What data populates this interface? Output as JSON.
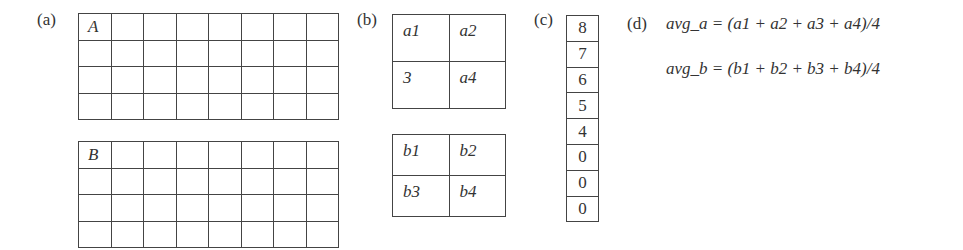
{
  "panels": {
    "a": {
      "label": "(a)",
      "grid_a": {
        "corner_label": "A",
        "rows": 4,
        "cols": 8
      },
      "grid_b": {
        "corner_label": "B",
        "rows": 4,
        "cols": 8
      }
    },
    "b": {
      "label": "(b)",
      "quad_a": [
        "a1",
        "a2",
        "3",
        "a4"
      ],
      "quad_b": [
        "b1",
        "b2",
        "b3",
        "b4"
      ]
    },
    "c": {
      "label": "(c)",
      "values": [
        "8",
        "7",
        "6",
        "5",
        "4",
        "0",
        "0",
        "0"
      ]
    },
    "d": {
      "label": "(d)",
      "formulas": [
        "avg_a = (a1 + a2 + a3 + a4)/4",
        "avg_b = (b1 + b2 + b3 + b4)/4"
      ]
    }
  }
}
